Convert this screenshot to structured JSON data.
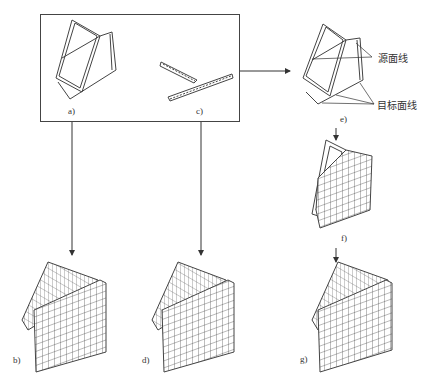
{
  "figure": {
    "panels": [
      {
        "id": "a",
        "label": "a)",
        "desc": "frame-wireframe"
      },
      {
        "id": "b",
        "label": "b)",
        "desc": "meshed-result-from-a"
      },
      {
        "id": "c",
        "label": "c)",
        "desc": "t-shaped-strip"
      },
      {
        "id": "d",
        "label": "d)",
        "desc": "meshed-result-from-c"
      },
      {
        "id": "e",
        "label": "e)",
        "desc": "frame-with-source-target-lines"
      },
      {
        "id": "f",
        "label": "f)",
        "desc": "partially-meshed"
      },
      {
        "id": "g",
        "label": "g)",
        "desc": "fully-meshed"
      }
    ],
    "annotations": {
      "source_line": "源面线",
      "target_line": "目标面线"
    },
    "colors": {
      "line": "#333333",
      "background": "#ffffff"
    }
  }
}
